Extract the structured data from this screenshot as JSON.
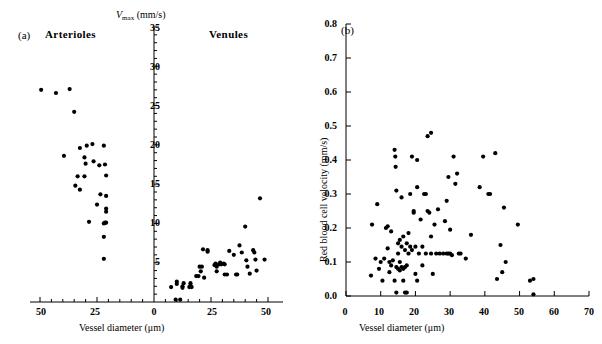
{
  "figure": {
    "width": 602,
    "height": 344,
    "background": "#ffffff",
    "marker_color": "#000000",
    "axis_color": "#000000"
  },
  "panel_a": {
    "letter": "(a)",
    "left_group_label": "Arterioles",
    "right_group_label": "Venules",
    "ylabel_prefix": "V",
    "ylabel_sub": "max",
    "ylabel_units": " (mm/s)",
    "xlabel": "Vessel diameter (μm)",
    "x_tick_labels": [
      "50",
      "25",
      "0",
      "25",
      "50"
    ],
    "y_tick_labels": [
      "5",
      "10",
      "15",
      "20",
      "25",
      "30",
      "35"
    ]
  },
  "panel_b": {
    "letter": "(b)",
    "ylabel": "Red blood cell velocity (mm/s)",
    "xlabel": "Vessel diameter (μm)",
    "x_tick_labels": [
      "0",
      "10",
      "20",
      "30",
      "40",
      "50",
      "60",
      "70"
    ],
    "y_tick_labels": [
      "0.0",
      "0.1",
      "0.2",
      "0.3",
      "0.4",
      "0.5",
      "0.6",
      "0.7",
      "0.8"
    ]
  },
  "chart_data": [
    {
      "type": "scatter",
      "panel": "(a)",
      "title": "",
      "xlabel": "Vessel diameter (μm)",
      "ylabel": "Vmax (mm/s)",
      "xlim": [
        -55,
        55
      ],
      "ylim": [
        0,
        35
      ],
      "xtick_values": [
        -50,
        -25,
        0,
        25,
        50
      ],
      "xtick_labels": [
        "50",
        "25",
        "0",
        "25",
        "50"
      ],
      "ytick_values": [
        5,
        10,
        15,
        20,
        25,
        30,
        35
      ],
      "ytick_labels": [
        "5",
        "10",
        "15",
        "20",
        "25",
        "30",
        "35"
      ],
      "grid": false,
      "legend": "none",
      "annotations": [
        "Arterioles",
        "Venules"
      ],
      "note": "x negative side = arterioles (plotted as positive diameters increasing leftward), x positive side = venules",
      "series": [
        {
          "name": "Arterioles",
          "marker": "filled-circle",
          "points": [
            [
              -49.5,
              27.0
            ],
            [
              -43.0,
              26.6
            ],
            [
              -37.0,
              27.1
            ],
            [
              -35.0,
              24.2
            ],
            [
              -32.5,
              19.6
            ],
            [
              -29.5,
              19.9
            ],
            [
              -27.0,
              20.1
            ],
            [
              -22.0,
              19.9
            ],
            [
              -39.5,
              18.6
            ],
            [
              -30.0,
              17.6
            ],
            [
              -26.5,
              17.9
            ],
            [
              -30.5,
              18.4
            ],
            [
              -24.0,
              17.4
            ],
            [
              -21.5,
              17.5
            ],
            [
              -33.5,
              16.0
            ],
            [
              -30.5,
              16.0
            ],
            [
              -21.0,
              16.1
            ],
            [
              -34.5,
              14.8
            ],
            [
              -32.5,
              14.3
            ],
            [
              -23.5,
              13.7
            ],
            [
              -21.0,
              13.5
            ],
            [
              -25.0,
              12.4
            ],
            [
              -21.0,
              11.9
            ],
            [
              -21.0,
              11.5
            ],
            [
              -28.5,
              10.2
            ],
            [
              -21.5,
              10.1
            ],
            [
              -21.0,
              10.1
            ],
            [
              -22.0,
              10.0
            ],
            [
              -22.0,
              8.3
            ],
            [
              -22.0,
              5.5
            ]
          ]
        },
        {
          "name": "Venules",
          "marker": "filled-circle",
          "points": [
            [
              7.5,
              1.9
            ],
            [
              9.5,
              0.3
            ],
            [
              10.0,
              2.3
            ],
            [
              10.0,
              2.6
            ],
            [
              11.5,
              0.3
            ],
            [
              12.5,
              1.8
            ],
            [
              12.5,
              2.0
            ],
            [
              13.0,
              2.4
            ],
            [
              15.5,
              1.9
            ],
            [
              16.0,
              2.1
            ],
            [
              16.0,
              2.4
            ],
            [
              16.5,
              1.9
            ],
            [
              18.5,
              3.3
            ],
            [
              19.5,
              3.3
            ],
            [
              20.5,
              3.9
            ],
            [
              20.0,
              4.5
            ],
            [
              21.0,
              4.5
            ],
            [
              21.5,
              6.7
            ],
            [
              22.0,
              3.1
            ],
            [
              23.5,
              6.4
            ],
            [
              23.5,
              6.6
            ],
            [
              26.5,
              4.7
            ],
            [
              27.0,
              4.9
            ],
            [
              27.5,
              4.5
            ],
            [
              27.5,
              3.9
            ],
            [
              28.5,
              4.8
            ],
            [
              29.0,
              5.0
            ],
            [
              29.5,
              4.8
            ],
            [
              30.5,
              4.9
            ],
            [
              31.0,
              4.8
            ],
            [
              31.0,
              3.5
            ],
            [
              32.0,
              3.5
            ],
            [
              33.0,
              6.5
            ],
            [
              35.0,
              6.0
            ],
            [
              36.0,
              3.5
            ],
            [
              36.5,
              3.5
            ],
            [
              37.5,
              7.2
            ],
            [
              38.5,
              6.3
            ],
            [
              40.0,
              9.6
            ],
            [
              40.5,
              5.3
            ],
            [
              41.0,
              4.5
            ],
            [
              42.0,
              3.6
            ],
            [
              43.5,
              6.6
            ],
            [
              44.0,
              6.3
            ],
            [
              44.5,
              5.4
            ],
            [
              45.0,
              4.0
            ],
            [
              46.5,
              13.2
            ],
            [
              48.5,
              5.4
            ]
          ]
        }
      ]
    },
    {
      "type": "scatter",
      "panel": "(b)",
      "title": "",
      "xlabel": "Vessel diameter (μm)",
      "ylabel": "Red blood cell velocity (mm/s)",
      "xlim": [
        0,
        70
      ],
      "ylim": [
        0.0,
        0.8
      ],
      "xtick_values": [
        0,
        10,
        20,
        30,
        40,
        50,
        60,
        70
      ],
      "xtick_labels": [
        "0",
        "10",
        "20",
        "30",
        "40",
        "50",
        "60",
        "70"
      ],
      "ytick_values": [
        0.0,
        0.1,
        0.2,
        0.3,
        0.4,
        0.5,
        0.6,
        0.7,
        0.8
      ],
      "ytick_labels": [
        "0.0",
        "0.1",
        "0.2",
        "0.3",
        "0.4",
        "0.5",
        "0.6",
        "0.7",
        "0.8"
      ],
      "grid": false,
      "legend": "none",
      "series": [
        {
          "name": "Red blood cell velocity",
          "marker": "filled-circle",
          "points": [
            [
              7.2,
              0.06
            ],
            [
              7.5,
              0.21
            ],
            [
              8.5,
              0.11
            ],
            [
              9.0,
              0.27
            ],
            [
              9.5,
              0.08
            ],
            [
              10.0,
              0.1
            ],
            [
              10.5,
              0.045
            ],
            [
              11.0,
              0.11
            ],
            [
              11.5,
              0.2
            ],
            [
              12.0,
              0.205
            ],
            [
              12.0,
              0.14
            ],
            [
              12.5,
              0.07
            ],
            [
              12.5,
              0.1
            ],
            [
              13.0,
              0.09
            ],
            [
              13.0,
              0.19
            ],
            [
              13.5,
              0.105
            ],
            [
              14.0,
              0.045
            ],
            [
              14.0,
              0.43
            ],
            [
              14.2,
              0.41
            ],
            [
              14.3,
              0.38
            ],
            [
              14.5,
              0.31
            ],
            [
              14.5,
              0.085
            ],
            [
              14.5,
              0.01
            ],
            [
              15.0,
              0.155
            ],
            [
              15.0,
              0.125
            ],
            [
              15.0,
              0.08
            ],
            [
              15.5,
              0.165
            ],
            [
              15.5,
              0.1
            ],
            [
              15.5,
              0.075
            ],
            [
              16.0,
              0.145
            ],
            [
              16.0,
              0.085
            ],
            [
              16.0,
              0.29
            ],
            [
              16.5,
              0.175
            ],
            [
              16.5,
              0.08
            ],
            [
              16.5,
              0.045
            ],
            [
              17.0,
              0.135
            ],
            [
              17.0,
              0.085
            ],
            [
              17.0,
              0.01
            ],
            [
              17.5,
              0.155
            ],
            [
              17.5,
              0.09
            ],
            [
              17.5,
              0.01
            ],
            [
              18.0,
              0.125
            ],
            [
              18.0,
              0.185
            ],
            [
              18.5,
              0.145
            ],
            [
              18.5,
              0.3
            ],
            [
              19.0,
              0.135
            ],
            [
              19.0,
              0.41
            ],
            [
              19.5,
              0.25
            ],
            [
              19.5,
              0.245
            ],
            [
              20.0,
              0.145
            ],
            [
              20.0,
              0.065
            ],
            [
              20.5,
              0.4
            ],
            [
              20.5,
              0.32
            ],
            [
              20.5,
              0.045
            ],
            [
              21.0,
              0.125
            ],
            [
              21.5,
              0.225
            ],
            [
              22.0,
              0.145
            ],
            [
              22.0,
              0.09
            ],
            [
              22.5,
              0.3
            ],
            [
              23.0,
              0.3
            ],
            [
              23.0,
              0.125
            ],
            [
              23.5,
              0.25
            ],
            [
              23.5,
              0.47
            ],
            [
              24.0,
              0.245
            ],
            [
              24.5,
              0.48
            ],
            [
              24.5,
              0.175
            ],
            [
              24.5,
              0.125
            ],
            [
              25.0,
              0.065
            ],
            [
              25.5,
              0.21
            ],
            [
              26.0,
              0.125
            ],
            [
              26.5,
              0.255
            ],
            [
              27.0,
              0.125
            ],
            [
              28.0,
              0.125
            ],
            [
              28.5,
              0.22
            ],
            [
              29.0,
              0.125
            ],
            [
              29.0,
              0.28
            ],
            [
              29.5,
              0.35
            ],
            [
              29.5,
              0.125
            ],
            [
              30.0,
              0.195
            ],
            [
              30.0,
              0.125
            ],
            [
              30.5,
              0.12
            ],
            [
              31.0,
              0.41
            ],
            [
              31.5,
              0.33
            ],
            [
              32.0,
              0.36
            ],
            [
              32.5,
              0.125
            ],
            [
              33.0,
              0.125
            ],
            [
              34.5,
              0.11
            ],
            [
              36.0,
              0.18
            ],
            [
              38.5,
              0.32
            ],
            [
              39.5,
              0.41
            ],
            [
              41.0,
              0.3
            ],
            [
              41.5,
              0.3
            ],
            [
              43.0,
              0.42
            ],
            [
              43.5,
              0.05
            ],
            [
              44.5,
              0.15
            ],
            [
              45.0,
              0.07
            ],
            [
              45.5,
              0.26
            ],
            [
              46.0,
              0.1
            ],
            [
              49.5,
              0.21
            ],
            [
              53.0,
              0.045
            ],
            [
              54.0,
              0.05
            ],
            [
              54.0,
              0.005
            ]
          ]
        }
      ]
    }
  ]
}
